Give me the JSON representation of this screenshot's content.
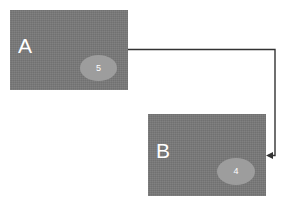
{
  "diagram": {
    "background_color": "#ffffff",
    "node_fill_color": "#787878",
    "port_fill_color": "#9d9d9d",
    "label_text_color": "#ffffff",
    "edge_color": "#333333",
    "nodes": [
      {
        "id": "a",
        "label": "A",
        "port": {
          "label": "5"
        }
      },
      {
        "id": "b",
        "label": "B",
        "port": {
          "label": "4"
        }
      }
    ],
    "edges": [
      {
        "id": "a-to-b",
        "from": "a",
        "to": "b",
        "arrowhead": "arrow-head-icon"
      }
    ]
  }
}
